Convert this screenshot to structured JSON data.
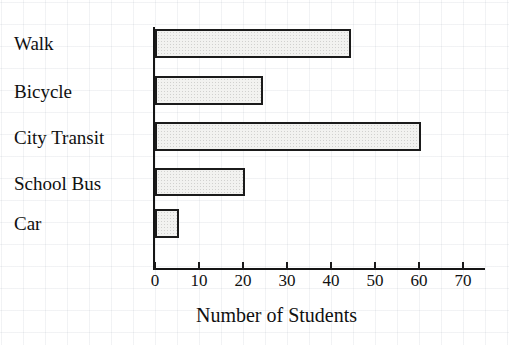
{
  "chart_data": {
    "type": "bar",
    "orientation": "horizontal",
    "title": "",
    "xlabel": "Number of Students",
    "ylabel": "",
    "categories": [
      "Walk",
      "Bicycle",
      "City Transit",
      "School Bus",
      "Car"
    ],
    "values": [
      44,
      24,
      60,
      20,
      5
    ],
    "xlim": [
      0,
      75
    ],
    "xticks": [
      0,
      10,
      20,
      30,
      40,
      50,
      60,
      70
    ],
    "xtick_labels": [
      "0",
      "10",
      "20",
      "30",
      "40",
      "50",
      "60",
      "70"
    ],
    "grid": true,
    "legend": null,
    "bar_fill": "#f2f2f0",
    "bar_stroke": "#1b1b1b",
    "axis_color": "#151515",
    "text_color": "#101010"
  }
}
